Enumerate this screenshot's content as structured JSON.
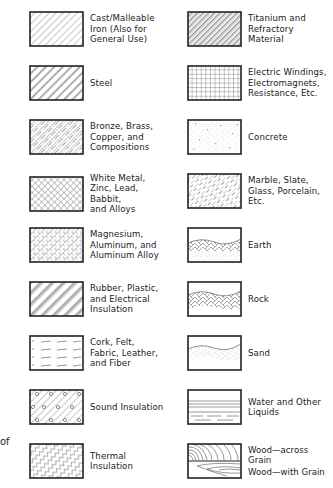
{
  "edge_fragment": "of",
  "left_column": [
    {
      "label": "Cast/Malleable\nIron (Also for\nGeneral Use)",
      "pattern": "diagonal-thin-lines"
    },
    {
      "label": "Steel",
      "pattern": "diagonal-paired-lines"
    },
    {
      "label": "Bronze, Brass,\nCopper, and\nCompositions",
      "pattern": "diagonal-dash-dot-lines"
    },
    {
      "label": "White Metal,\nZinc, Lead, Babbit,\nand Alloys",
      "pattern": "cross-hatch-diagonal"
    },
    {
      "label": "Magnesium,\nAluminum, and\nAluminum Alloy",
      "pattern": "cross-hatch-dashed"
    },
    {
      "label": "Rubber, Plastic,\nand Electrical\nInsulation",
      "pattern": "diagonal-grouped-lines"
    },
    {
      "label": "Cork, Felt,\nFabric, Leather,\nand Fiber",
      "pattern": "horizontal-dashes"
    },
    {
      "label": "Sound Insulation",
      "pattern": "diagonal-with-circles"
    },
    {
      "label": "Thermal\nInsulation",
      "pattern": "diagonal-wavy"
    }
  ],
  "right_column": [
    {
      "label": "Titanium and\nRefractory\nMaterial",
      "pattern": "diagonal-thick-thin"
    },
    {
      "label": "Electric Windings,\nElectromagnets,\nResistance, Etc.",
      "pattern": "square-grid"
    },
    {
      "label": "Concrete",
      "pattern": "stipple-aggregate"
    },
    {
      "label": "Marble, Slate,\nGlass, Porcelain,\nEtc.",
      "pattern": "diagonal-dashed-lines"
    },
    {
      "label": "Earth",
      "pattern": "earth-chevron-stipple"
    },
    {
      "label": "Rock",
      "pattern": "rock-chevron"
    },
    {
      "label": "Sand",
      "pattern": "sand-stipple"
    },
    {
      "label": "Water and Other\nLiquids",
      "pattern": "horizontal-lines-water"
    },
    {
      "label_top": "Wood—across Grain",
      "label_bottom": "Wood—with Grain",
      "pattern": "wood-grain"
    }
  ]
}
